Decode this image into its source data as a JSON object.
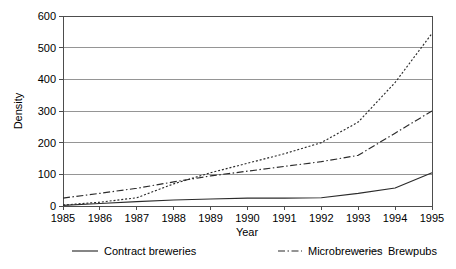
{
  "chart_data": {
    "type": "line",
    "title": "",
    "xlabel": "Year",
    "ylabel": "Density",
    "x": [
      1985,
      1986,
      1987,
      1988,
      1989,
      1990,
      1991,
      1992,
      1993,
      1994,
      1995
    ],
    "xtick_labels": [
      "1985",
      "1986",
      "1987",
      "1988",
      "1989",
      "1990",
      "1991",
      "1992",
      "1993",
      "1994",
      "1995"
    ],
    "ytick_labels": [
      "0",
      "100",
      "200",
      "300",
      "400",
      "500",
      "600"
    ],
    "yticks": [
      0,
      100,
      200,
      300,
      400,
      500,
      600
    ],
    "xlim": [
      1985,
      1995
    ],
    "ylim": [
      0,
      600
    ],
    "grid": "horizontal",
    "legend_position": "bottom",
    "series": [
      {
        "name": "Contract breweries",
        "linestyle": "solid",
        "color": "#2b2b2b",
        "values": [
          2,
          8,
          14,
          19,
          22,
          25,
          25,
          26,
          40,
          57,
          105
        ]
      },
      {
        "name": "Microbreweries",
        "linestyle": "dashdot",
        "color": "#2b2b2b",
        "values": [
          25,
          40,
          56,
          76,
          95,
          110,
          125,
          140,
          160,
          230,
          300
        ]
      },
      {
        "name": "Brewpubs",
        "linestyle": "dotted",
        "color": "#2b2b2b",
        "values": [
          3,
          12,
          26,
          70,
          105,
          135,
          165,
          200,
          265,
          390,
          545
        ]
      }
    ]
  },
  "axes": {
    "xlabel": "Year",
    "ylabel": "Density"
  },
  "legend": {
    "items": [
      {
        "label": "Contract breweries",
        "style": "solid"
      },
      {
        "label": "Microbreweries",
        "style": "dashdot"
      },
      {
        "label": "Brewpubs",
        "style": "dotted"
      }
    ]
  },
  "colors": {
    "background": "#ffffff",
    "gridline": "#8a8a8a",
    "axis": "#4d4d4d",
    "series": "#2b2b2b",
    "text": "#000000"
  }
}
